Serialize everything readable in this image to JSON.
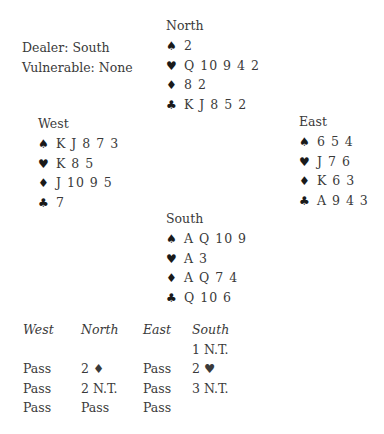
{
  "deal_info": {
    "dealer": "Dealer: South",
    "vulnerable": "Vulnerable: None"
  },
  "suits": {
    "spades": "♠",
    "hearts": "♥",
    "diamonds": "♦",
    "clubs": "♣"
  },
  "hands": {
    "north": {
      "title": "North",
      "spades": "2",
      "hearts": "Q 10 9 4 2",
      "diamonds": "8 2",
      "clubs": "K J 8 5 2"
    },
    "west": {
      "title": "West",
      "spades": "K J 8 7 3",
      "hearts": "K 8 5",
      "diamonds": "J 10 9 5",
      "clubs": "7"
    },
    "east": {
      "title": "East",
      "spades": "6 5 4",
      "hearts": "J 7 6",
      "diamonds": "K 6 3",
      "clubs": "A 9 4 3"
    },
    "south": {
      "title": "South",
      "spades": "A Q 10 9",
      "hearts": "A 3",
      "diamonds": "A Q 7 4",
      "clubs": "Q 10 6"
    }
  },
  "auction": {
    "headers": [
      "West",
      "North",
      "East",
      "South"
    ],
    "rows": [
      [
        "",
        "",
        "",
        "1 N.T."
      ],
      [
        "Pass",
        "2 ♦",
        "Pass",
        "2 ♥"
      ],
      [
        "Pass",
        "2 N.T.",
        "Pass",
        "3 N.T."
      ],
      [
        "Pass",
        "Pass",
        "Pass",
        ""
      ]
    ]
  }
}
